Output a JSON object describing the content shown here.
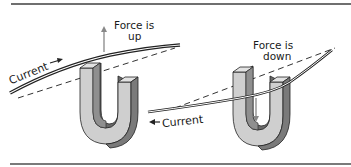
{
  "diagram": {
    "left_panel": {
      "current_label": "Current",
      "current_arrow": "right-arrow",
      "force_label_line1": "Force is",
      "force_label_line2": "up",
      "force_arrow": "up-arrow"
    },
    "right_panel": {
      "current_label": "Current",
      "current_arrow": "left-arrow",
      "force_label_line1": "Force is",
      "force_label_line2": "down",
      "force_arrow": "down-arrow"
    },
    "colors": {
      "magnet_light": "#c8c8c8",
      "magnet_dark": "#6a6a6a",
      "magnet_mid": "#9a9a9a",
      "wire": "#2a2a2a",
      "rule": "#6f6f6f",
      "arrow": "#8a8a8a"
    }
  }
}
